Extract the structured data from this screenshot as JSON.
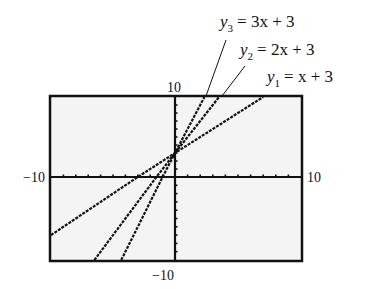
{
  "chart_data": {
    "type": "line",
    "title": "",
    "xlabel": "",
    "ylabel": "",
    "xlim": [
      -10,
      10
    ],
    "ylim": [
      -10,
      10
    ],
    "grid": false,
    "tick_labels": {
      "x_min": "−10",
      "x_max": "10",
      "y_min": "−10",
      "y_max": "10"
    },
    "series": [
      {
        "name": "y1 = x + 3",
        "slope": 1,
        "intercept": 3,
        "x": [
          -10,
          7
        ],
        "y": [
          -7,
          10
        ]
      },
      {
        "name": "y2 = 2x + 3",
        "slope": 2,
        "intercept": 3,
        "x": [
          -6.5,
          3.5
        ],
        "y": [
          -10,
          10
        ]
      },
      {
        "name": "y3 = 3x + 3",
        "slope": 3,
        "intercept": 3,
        "x": [
          -4.33,
          2.33
        ],
        "y": [
          -10,
          10
        ]
      }
    ],
    "annotations": [
      {
        "label_var": "y",
        "label_sub": "3",
        "label_rhs": "= 3x + 3"
      },
      {
        "label_var": "y",
        "label_sub": "2",
        "label_rhs": "= 2x + 3"
      },
      {
        "label_var": "y",
        "label_sub": "1",
        "label_rhs": "= x + 3"
      }
    ]
  }
}
